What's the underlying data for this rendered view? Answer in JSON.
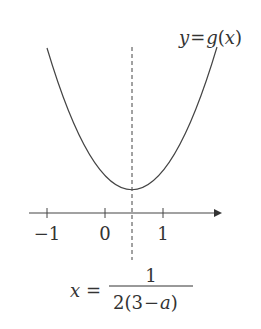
{
  "figure": {
    "curve_label": {
      "y": "y",
      "eq": "=",
      "g": "g",
      "open": "(",
      "x": "x",
      "close": ")"
    },
    "axis": {
      "ticks": [
        {
          "label": "−1",
          "value": -1
        },
        {
          "label": "0",
          "value": 0
        },
        {
          "label": "1",
          "value": 1
        }
      ]
    },
    "axis_of_symmetry": {
      "lhs": "x",
      "eq": "=",
      "numerator": "1",
      "denominator_prefix": "2(3",
      "denominator_minus": "−",
      "denominator_var": "a",
      "denominator_suffix": ")"
    },
    "colors": {
      "curve": "#444444",
      "text": "#333333",
      "background": "#ffffff"
    }
  }
}
